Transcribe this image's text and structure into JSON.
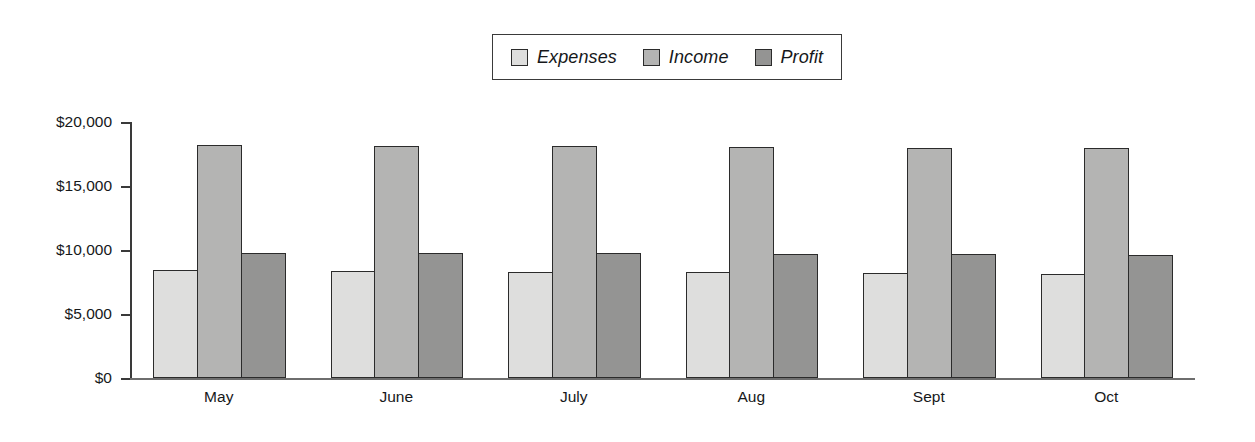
{
  "chart_data": {
    "type": "bar",
    "title": "",
    "subtitle": "",
    "xlabel": "",
    "ylabel": "",
    "grid": false,
    "legend_position": "top-center",
    "orientation": "vertical",
    "grouping": "clustered",
    "categories": [
      "May",
      "June",
      "July",
      "Aug",
      "Sept",
      "Oct"
    ],
    "ylim": [
      0,
      20000
    ],
    "ytick_values": [
      0,
      5000,
      10000,
      15000,
      20000
    ],
    "ytick_labels": [
      "$0",
      "$5,000",
      "$10,000",
      "$15,000",
      "$20,000"
    ],
    "series": [
      {
        "name": "Expenses",
        "color": "#dededd",
        "values": [
          8400,
          8350,
          8300,
          8250,
          8200,
          8100
        ]
      },
      {
        "name": "Income",
        "color": "#b4b4b3",
        "values": [
          18200,
          18150,
          18100,
          18050,
          18000,
          17950
        ]
      },
      {
        "name": "Profit",
        "color": "#949493",
        "values": [
          9800,
          9780,
          9750,
          9700,
          9650,
          9600
        ]
      }
    ]
  },
  "legend": {
    "entries": [
      {
        "label": "Expenses",
        "swatch": "legend-swatch-expenses"
      },
      {
        "label": "Income",
        "swatch": "legend-swatch-income"
      },
      {
        "label": "Profit",
        "swatch": "legend-swatch-profit"
      }
    ]
  }
}
